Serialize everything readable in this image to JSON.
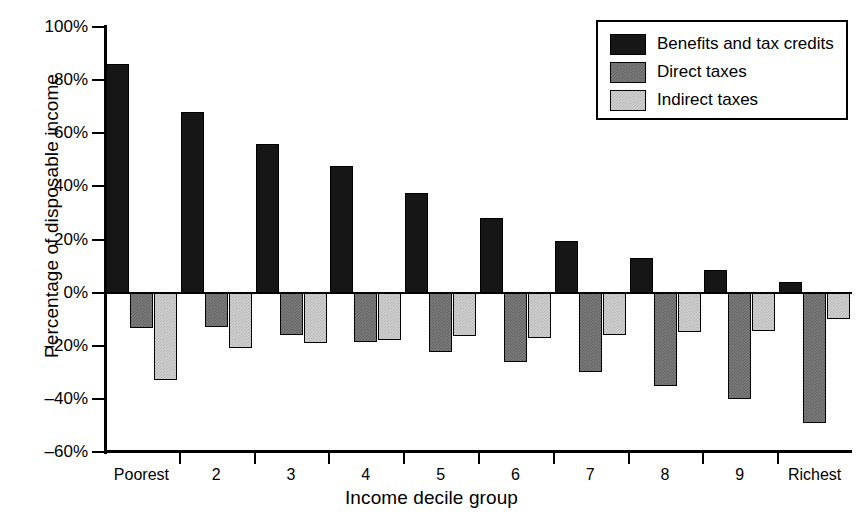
{
  "chart_data": {
    "type": "bar",
    "title": "",
    "xlabel": "Income decile group",
    "ylabel": "Percentage of disposable income",
    "categories": [
      "Poorest",
      "2",
      "3",
      "4",
      "5",
      "6",
      "7",
      "8",
      "9",
      "Richest"
    ],
    "ylim": [
      -60,
      100
    ],
    "ytick_values": [
      100,
      80,
      60,
      40,
      20,
      0,
      -20,
      -40,
      -60
    ],
    "ytick_labels": [
      "100%",
      "80%",
      "60%",
      "40%",
      "20%",
      "0%",
      "–20%",
      "–40%",
      "–60%"
    ],
    "grid": false,
    "legend_position": "top-right",
    "series": [
      {
        "name": "Benefits and tax credits",
        "color": "#161616",
        "values": [
          86,
          68,
          56,
          47.5,
          37.5,
          28,
          19.5,
          13,
          8.5,
          4
        ]
      },
      {
        "name": "Direct taxes",
        "color": "#7e7e7e",
        "values": [
          -13.5,
          -13,
          -16,
          -18.5,
          -22.5,
          -26,
          -30,
          -35,
          -40,
          -49
        ]
      },
      {
        "name": "Indirect taxes",
        "color": "#d2d2d2",
        "values": [
          -33,
          -21,
          -19,
          -18,
          -16.5,
          -17,
          -16,
          -15,
          -14.5,
          -10
        ]
      }
    ]
  },
  "legend": {
    "items": [
      {
        "label": "Benefits and tax credits",
        "swatch": "benefits"
      },
      {
        "label": "Direct taxes",
        "swatch": "direct"
      },
      {
        "label": "Indirect taxes",
        "swatch": "indirect"
      }
    ]
  }
}
